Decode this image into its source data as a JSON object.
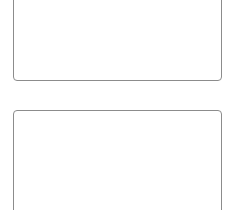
{
  "panels": [
    {
      "id": "top",
      "content": ""
    },
    {
      "id": "bottom",
      "content": ""
    }
  ],
  "colors": {
    "border": "#8c8c8c",
    "background": "#ffffff"
  }
}
